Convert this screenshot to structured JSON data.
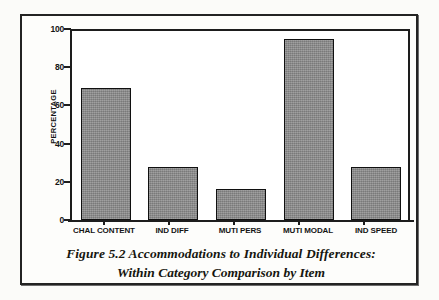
{
  "figure": {
    "caption_line_1": "Figure 5.2  Accommodations to Individual Differences:",
    "caption_line_2": "Within Category Comparison by Item"
  },
  "chart_data": {
    "type": "bar",
    "title": "",
    "categories": [
      "CHAL CONTENT",
      "IND DIFF",
      "MUTI PERS",
      "MUTI MODAL",
      "IND SPEED"
    ],
    "values": [
      69,
      28,
      16,
      95,
      27.5
    ],
    "xlabel": "",
    "ylabel": "PERCENTAGE",
    "ylim": [
      0,
      100
    ],
    "yticks": [
      0,
      20,
      40,
      60,
      80,
      100
    ],
    "ytick_labels": [
      "0",
      "20",
      "40",
      "60",
      "80",
      "100"
    ],
    "grid": false,
    "legend": "none",
    "bar_fill_color": "#8b8b8b",
    "bar_edge_color": "#101010",
    "axis_color": "#1d1d1d",
    "background_color": "#ffffff"
  }
}
